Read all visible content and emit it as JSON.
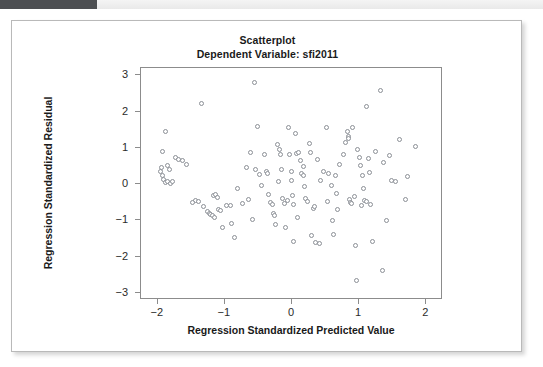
{
  "window": {
    "topbar_accent_color": "#4d4f52",
    "topbar_background_color": "#eeeeee"
  },
  "card": {
    "background_color": "#ffffff",
    "border_color": "#b9b9b9"
  },
  "chart_data": {
    "type": "scatter",
    "title": "Scatterplot",
    "subtitle": "Dependent Variable: sfi2011",
    "xlabel": "Regression Standardized Predicted Value",
    "ylabel": "Regression Standardized Residual",
    "xlim": [
      -2.25,
      2.25
    ],
    "ylim": [
      -3.2,
      3.2
    ],
    "xticks": [
      -2,
      -1,
      0,
      1,
      2
    ],
    "xticklabels": [
      "−2",
      "−1",
      "0",
      "1",
      "2"
    ],
    "yticks": [
      3,
      2,
      1,
      0,
      -1,
      -2,
      -3
    ],
    "yticklabels": [
      "3",
      "2",
      "1",
      "0",
      "−1",
      "−2",
      "−3"
    ],
    "grid": false,
    "legend": "none",
    "marker": {
      "shape": "open-circle",
      "edge_color": "#8b8f96",
      "fill_color": "#ffffff",
      "size_px": 5
    },
    "n_points": 139,
    "points": [
      [
        -1.91,
        0.86
      ],
      [
        -1.87,
        1.43
      ],
      [
        -1.93,
        0.44
      ],
      [
        -1.95,
        0.32
      ],
      [
        -1.92,
        0.2
      ],
      [
        -1.9,
        0.11
      ],
      [
        -1.87,
        0.02
      ],
      [
        -1.84,
        0.04
      ],
      [
        -1.8,
        0.0
      ],
      [
        -1.76,
        0.03
      ],
      [
        -1.72,
        0.7
      ],
      [
        -1.67,
        0.66
      ],
      [
        -1.62,
        0.63
      ],
      [
        -1.56,
        0.5
      ],
      [
        -1.42,
        -0.47
      ],
      [
        -1.38,
        -0.5
      ],
      [
        -1.33,
        2.2
      ],
      [
        -1.31,
        -0.66
      ],
      [
        -1.25,
        -0.78
      ],
      [
        -1.22,
        -0.83
      ],
      [
        -1.2,
        -0.87
      ],
      [
        -1.17,
        -0.9
      ],
      [
        -1.14,
        -0.94
      ],
      [
        -1.16,
        -0.34
      ],
      [
        -1.12,
        -0.31
      ],
      [
        -1.1,
        -0.4
      ],
      [
        -1.08,
        -0.72
      ],
      [
        -1.05,
        -0.76
      ],
      [
        -1.02,
        -1.22
      ],
      [
        -0.96,
        -0.61
      ],
      [
        -0.88,
        -1.13
      ],
      [
        -0.84,
        -1.51
      ],
      [
        -0.8,
        -0.15
      ],
      [
        -0.63,
        -0.46
      ],
      [
        -0.6,
        0.85
      ],
      [
        -0.58,
        -1.0
      ],
      [
        -0.55,
        2.78
      ],
      [
        -0.53,
        0.36
      ],
      [
        -0.5,
        1.56
      ],
      [
        -0.47,
        0.23
      ],
      [
        -0.44,
        -0.06
      ],
      [
        -0.4,
        0.79
      ],
      [
        -0.37,
        0.33
      ],
      [
        -0.34,
        -0.33
      ],
      [
        -0.31,
        -0.53
      ],
      [
        -0.28,
        -0.6
      ],
      [
        -0.26,
        -0.83
      ],
      [
        -0.25,
        -0.9
      ],
      [
        -0.23,
        -1.14
      ],
      [
        -0.2,
        1.07
      ],
      [
        -0.17,
        0.92
      ],
      [
        -0.15,
        0.78
      ],
      [
        -0.14,
        0.37
      ],
      [
        -0.12,
        -0.44
      ],
      [
        -0.1,
        -0.57
      ],
      [
        -0.08,
        -1.22
      ],
      [
        -0.04,
        1.53
      ],
      [
        -0.02,
        0.79
      ],
      [
        0.0,
        0.33
      ],
      [
        0.01,
        0.07
      ],
      [
        0.02,
        -0.34
      ],
      [
        0.03,
        -0.58
      ],
      [
        0.04,
        -1.62
      ],
      [
        0.06,
        1.37
      ],
      [
        0.08,
        0.81
      ],
      [
        0.11,
        0.84
      ],
      [
        0.14,
        0.61
      ],
      [
        0.16,
        0.25
      ],
      [
        0.18,
        0.2
      ],
      [
        0.2,
        -0.09
      ],
      [
        0.22,
        -0.43
      ],
      [
        0.24,
        -0.5
      ],
      [
        0.27,
        1.09
      ],
      [
        0.29,
        0.85
      ],
      [
        0.31,
        -1.44
      ],
      [
        0.33,
        -0.71
      ],
      [
        0.35,
        -0.65
      ],
      [
        0.37,
        -1.65
      ],
      [
        0.4,
        0.64
      ],
      [
        0.43,
        -1.67
      ],
      [
        0.53,
        1.54
      ],
      [
        0.56,
        0.26
      ],
      [
        0.6,
        -0.08
      ],
      [
        0.62,
        -1.04
      ],
      [
        0.64,
        -1.42
      ],
      [
        0.66,
        0.22
      ],
      [
        0.68,
        -0.29
      ],
      [
        0.7,
        -0.74
      ],
      [
        0.78,
        0.8
      ],
      [
        0.81,
        1.13
      ],
      [
        0.84,
        1.42
      ],
      [
        0.85,
        1.29
      ],
      [
        0.86,
        1.24
      ],
      [
        0.87,
        -0.46
      ],
      [
        0.88,
        -0.53
      ],
      [
        0.9,
        -0.57
      ],
      [
        0.92,
        1.52
      ],
      [
        0.94,
        -0.36
      ],
      [
        0.96,
        -1.73
      ],
      [
        0.98,
        -2.7
      ],
      [
        1.02,
        0.7
      ],
      [
        1.04,
        0.47
      ],
      [
        1.06,
        0.2
      ],
      [
        1.08,
        -0.16
      ],
      [
        1.1,
        -0.48
      ],
      [
        1.12,
        -0.52
      ],
      [
        1.13,
        2.12
      ],
      [
        1.15,
        0.67
      ],
      [
        1.17,
        0.3
      ],
      [
        1.19,
        -0.6
      ],
      [
        1.21,
        -1.6
      ],
      [
        1.33,
        2.56
      ],
      [
        1.36,
        -2.4
      ],
      [
        1.38,
        0.56
      ],
      [
        1.42,
        -1.03
      ],
      [
        1.47,
        0.77
      ],
      [
        1.5,
        0.08
      ],
      [
        1.56,
        0.03
      ],
      [
        1.62,
        1.21
      ],
      [
        1.7,
        -0.45
      ],
      [
        1.85,
        1.02
      ],
      [
        -1.84,
        0.48
      ],
      [
        -1.81,
        0.38
      ],
      [
        -0.66,
        0.43
      ],
      [
        -0.35,
        0.26
      ],
      [
        -0.05,
        -0.48
      ],
      [
        0.19,
        0.46
      ],
      [
        0.48,
        0.32
      ],
      [
        0.73,
        0.52
      ],
      [
        0.99,
        0.92
      ],
      [
        1.26,
        0.88
      ],
      [
        -0.72,
        -0.56
      ],
      [
        -1.47,
        -0.55
      ],
      [
        0.09,
        -0.96
      ],
      [
        -0.9,
        -0.62
      ],
      [
        0.55,
        -0.51
      ],
      [
        1.05,
        -0.63
      ],
      [
        0.44,
        0.08
      ],
      [
        -0.19,
        0.05
      ],
      [
        1.73,
        0.18
      ]
    ]
  }
}
